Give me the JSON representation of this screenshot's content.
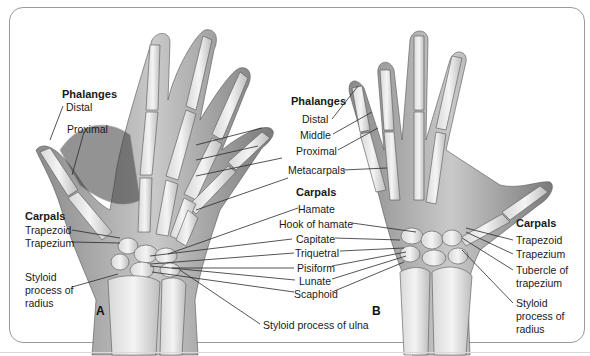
{
  "figure": {
    "panels": [
      "A",
      "B"
    ],
    "left_hand": {
      "phalanges_header": "Phalanges",
      "phalanges": [
        "Distal",
        "Proximal"
      ],
      "carpals_header": "Carpals",
      "carpals": [
        "Trapezoid",
        "Trapezium"
      ],
      "styloid_radius": [
        "Styloid",
        "process of",
        "radius"
      ]
    },
    "center": {
      "phalanges_header": "Phalanges",
      "phalanges": [
        "Distal",
        "Middle",
        "Proximal"
      ],
      "metacarpals": "Metacarpals",
      "carpals_header": "Carpals",
      "carpals": [
        "Hamate",
        "Hook of hamate",
        "Capitate",
        "Triquetral",
        "Pisiform",
        "Lunate",
        "Scaphoid"
      ],
      "styloid_ulna": "Styloid process of ulna"
    },
    "right_hand": {
      "carpals_header": "Carpals",
      "carpals": [
        "Trapezoid",
        "Trapezium"
      ],
      "tubercle": [
        "Tubercle of",
        "trapezium"
      ],
      "styloid_radius": [
        "Styloid",
        "process of",
        "radius"
      ]
    }
  }
}
